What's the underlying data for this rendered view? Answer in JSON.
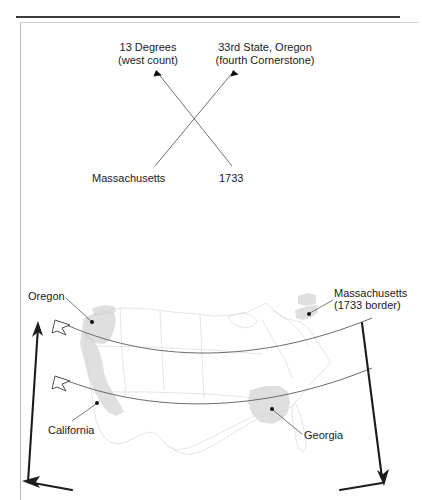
{
  "page": {
    "background_color": "#ffffff",
    "top_rule_color": "#3c3c3c",
    "box_border_color": "#b9b9b9"
  },
  "crossover_diagram": {
    "type": "cross-mapping",
    "top_left_label": "13 Degrees\n(west count)",
    "top_left_line1": "13 Degrees",
    "top_left_line2": "(west count)",
    "top_right_label": "33rd State, Oregon\n(fourth Cornerstone)",
    "top_right_line1": "33rd State, Oregon",
    "top_right_line2": "(fourth Cornerstone)",
    "bottom_left_label": "Massachusetts",
    "bottom_right_label": "1733",
    "connections": [
      {
        "from": "Massachusetts",
        "to": "33rd State, Oregon (fourth Cornerstone)"
      },
      {
        "from": "1733",
        "to": "13 Degrees (west count)"
      }
    ],
    "line_color": "#4a4a4a"
  },
  "map": {
    "region": "Contiguous United States",
    "outline_color": "#d8d8d8",
    "highlight_color": "#d2d2d2",
    "highlighted_states": [
      "Oregon",
      "California",
      "Massachusetts",
      "Georgia"
    ],
    "callouts": [
      {
        "name": "oregon",
        "label": "Oregon"
      },
      {
        "name": "massachusetts",
        "label": "Massachusetts\n(1733 border)",
        "line1": "Massachusetts",
        "line2": "(1733 border)"
      },
      {
        "name": "california",
        "label": "California"
      },
      {
        "name": "georgia",
        "label": "Georgia"
      }
    ],
    "arcs": [
      {
        "name": "north-arc",
        "from": "Oregon",
        "to": "Massachusetts (1733 border)"
      },
      {
        "name": "south-arc",
        "from": "California",
        "to": "Georgia"
      }
    ],
    "span_arrow": {
      "name": "measurement-span-arrow",
      "description": "double-headed span arrow framing the map"
    }
  }
}
